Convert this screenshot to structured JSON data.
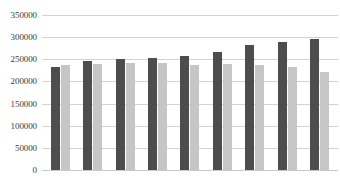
{
  "chart_data": {
    "type": "bar",
    "title": "",
    "subtitle": "",
    "xlabel": "",
    "ylabel": "",
    "ylim": [
      0,
      350000
    ],
    "y_ticks": [
      0,
      50000,
      100000,
      150000,
      200000,
      250000,
      300000,
      350000
    ],
    "y_tick_labels": [
      "0",
      "50000",
      "100000",
      "150000",
      "200000",
      "250000",
      "300000",
      "350000"
    ],
    "grid": true,
    "legend": false,
    "legend_position": "none",
    "categories": [
      "1",
      "2",
      "3",
      "4",
      "5",
      "6",
      "7",
      "8",
      "9"
    ],
    "x_tick_labels": [
      "",
      "",
      "",
      "",
      "",
      "",
      "",
      "",
      ""
    ],
    "series": [
      {
        "name": "Series 1",
        "color": "#4d4d4d",
        "values": [
          233000,
          247000,
          251000,
          253000,
          258000,
          267000,
          282000,
          289000,
          296000
        ]
      },
      {
        "name": "Series 2",
        "color": "#c6c6c6",
        "values": [
          238000,
          240000,
          242000,
          242000,
          238000,
          240000,
          238000,
          233000,
          222000
        ]
      }
    ]
  },
  "colors": {
    "background": "#ffffff",
    "gridline": "#d3d3d3",
    "axis_text": "#3a3a3a",
    "series_primary": "#4d4d4d",
    "series_secondary": "#c6c6c6"
  }
}
